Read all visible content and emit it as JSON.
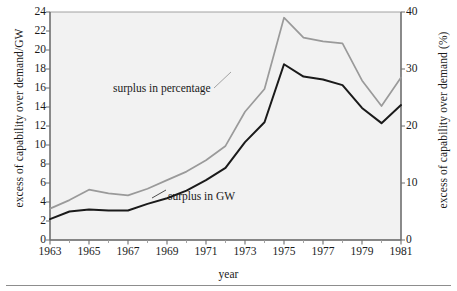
{
  "chart_data": {
    "type": "line",
    "title": "",
    "xlabel": "year",
    "ylabel": "excess of capability over demand/GW",
    "ylabel_right": "excess of capability over demand (%)",
    "xlim": [
      1963,
      1981
    ],
    "ylim": [
      0,
      24
    ],
    "ylim_right": [
      0,
      40
    ],
    "grid": false,
    "legend_position": "inline-annotations",
    "x": [
      1963,
      1964,
      1965,
      1966,
      1967,
      1968,
      1969,
      1970,
      1971,
      1972,
      1973,
      1974,
      1975,
      1976,
      1977,
      1978,
      1979,
      1980,
      1981
    ],
    "xticks": [
      1963,
      1965,
      1967,
      1969,
      1971,
      1973,
      1975,
      1977,
      1979,
      1981
    ],
    "xtick_labels": [
      "1963",
      "1965",
      "1967",
      "1969",
      "1971",
      "1973",
      "1975",
      "1977",
      "1979",
      "1981"
    ],
    "xminor_ticks": [
      1964,
      1966,
      1968,
      1970,
      1972,
      1974,
      1976,
      1978,
      1980
    ],
    "yticks_left": [
      0,
      2,
      4,
      6,
      8,
      10,
      12,
      14,
      16,
      18,
      20,
      22,
      24
    ],
    "ytick_labels_left": [
      "0",
      "2",
      "4",
      "6",
      "8",
      "10",
      "12",
      "14",
      "16",
      "18",
      "20",
      "22",
      "24"
    ],
    "yticks_right": [
      0,
      10,
      20,
      30,
      40
    ],
    "ytick_labels_right": [
      "0",
      "10",
      "20",
      "30",
      "40"
    ],
    "series": [
      {
        "name": "surplus in percentage",
        "axis": "right",
        "color": "#9a9a9a",
        "values_percent": [
          5.5,
          7.0,
          8.8,
          8.2,
          7.8,
          9.0,
          10.5,
          12.0,
          14.0,
          16.5,
          22.5,
          26.5,
          39.0,
          35.5,
          34.8,
          34.5,
          28.0,
          23.5,
          28.5
        ],
        "values_gw_scale": [
          3.3,
          4.2,
          5.3,
          4.9,
          4.7,
          5.4,
          6.3,
          7.2,
          8.4,
          9.9,
          13.5,
          15.9,
          23.4,
          21.3,
          20.9,
          20.7,
          16.8,
          14.1,
          17.1
        ]
      },
      {
        "name": "surplus in GW",
        "axis": "left",
        "color": "#1a1a1a",
        "values": [
          2.2,
          3.0,
          3.2,
          3.1,
          3.1,
          3.8,
          4.4,
          5.2,
          6.3,
          7.6,
          10.3,
          12.4,
          18.5,
          17.2,
          16.9,
          16.3,
          13.9,
          12.3,
          14.2
        ]
      }
    ],
    "annotations": [
      {
        "text": "surplus in percentage",
        "x": 1966.2,
        "y": 17.5
      },
      {
        "text": "surplus in GW",
        "x": 1969.0,
        "y": 6.6
      }
    ],
    "plot_background": "#f2f2f2",
    "axis_color": "#8d8d8d"
  }
}
